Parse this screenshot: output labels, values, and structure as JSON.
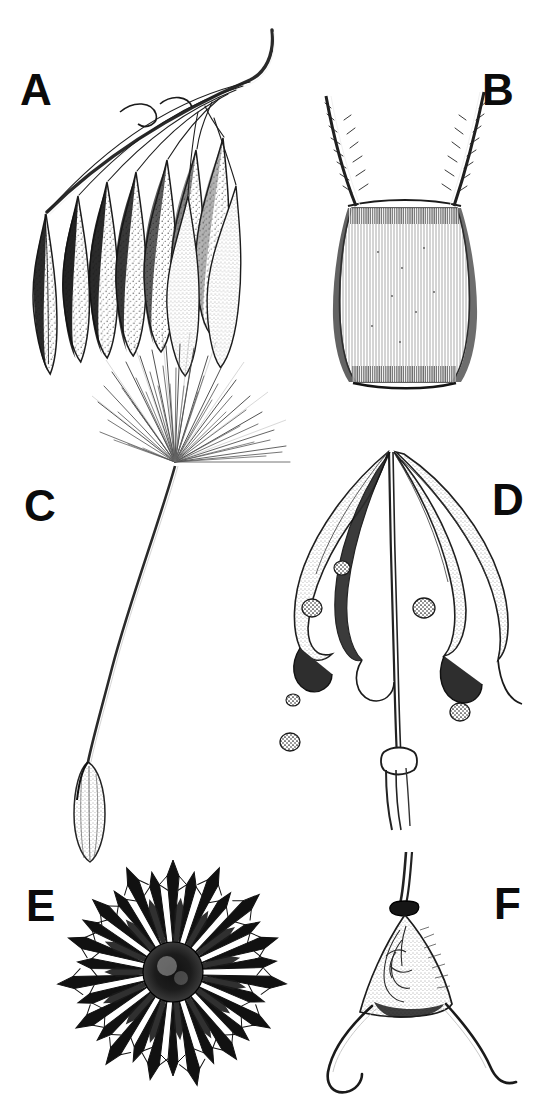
{
  "figure": {
    "kind": "scientific-illustration-plate",
    "medium": "pen-and-ink line drawing with stipple shading",
    "background_color": "#ffffff",
    "ink_color": "#111111",
    "panel_count": 6,
    "width_px": 543,
    "height_px": 1120
  },
  "labels": {
    "a": "A",
    "b": "B",
    "c": "C",
    "d": "D",
    "e": "E",
    "f": "F"
  },
  "panels": [
    {
      "id": "A",
      "label": "A",
      "title": "Cluster of pendulous plumed seeds on an arching rachis",
      "description": "A slender curved stalk arcs from lower-left to upper-right; from it hang roughly nine elongate teardrop-shaped seeds on fine thread-like stalks. Seed bodies are stippled pale with dark shading along one flank.",
      "label_position": {
        "x": 20,
        "y": 68
      },
      "seed_count": 9,
      "shading": "stipple with dense black flanks"
    },
    {
      "id": "B",
      "label": "B",
      "title": "Achene with two divergent barbed awns",
      "description": "An ovoid, vertically striate achene with a flat truncate base; two long awns diverge in a V from the shoulders, each fringed with fine retrorse barbs.",
      "label_position": {
        "x": 482,
        "y": 68
      },
      "awn_count": 2,
      "shading": "fine vertical hatching"
    },
    {
      "id": "C",
      "label": "C",
      "title": "Achene with long beak and parachute pappus",
      "description": "A dandelion-type diaspore: a narrow ribbed achene at the bottom, a long slender beak curving upward, topped by a radiating umbrella of very fine pappus bristles.",
      "label_position": {
        "x": 24,
        "y": 484
      },
      "pappus_type": "capillary bristles / parachute",
      "bristle_count_approx": 60
    },
    {
      "id": "D",
      "label": "D",
      "title": "Dehisced capsule with recurved valves and shed seeds",
      "description": "A capsule split into four elongate valves that curl outward and downward from a central column on an erect stalk; several small rounded stippled seeds are scattered around it.",
      "label_position": {
        "x": 492,
        "y": 478
      },
      "valve_count": 4,
      "loose_seed_count": 6
    },
    {
      "id": "E",
      "label": "E",
      "title": "Spherical burr armed with barbed spines",
      "description": "A globose fruit densely covered by stout radiating spines, each spine tipped with retrorse barbs; heavy black shading gives a near-silhouette sunburst.",
      "label_position": {
        "x": 26,
        "y": 884
      },
      "spine_count_approx": 30
    },
    {
      "id": "F",
      "label": "F",
      "title": "Triangular fruit with two recurved hooks",
      "description": "A stalked, triangular to heart-shaped fruit with a netted reticulate face; two long tapering horns sweep out from the basal corners and curve back as hooks.",
      "label_position": {
        "x": 494,
        "y": 882
      },
      "hook_count": 2
    }
  ]
}
